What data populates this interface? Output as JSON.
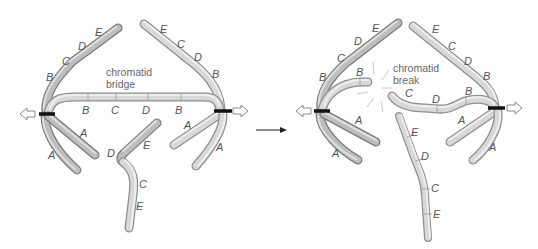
{
  "diagram": {
    "left_panel": {
      "caption_line1": "chromatid",
      "caption_line2": "bridge",
      "upper_left_arm_labels": [
        "B",
        "C",
        "D",
        "E"
      ],
      "upper_right_arm_labels": [
        "E",
        "C",
        "D",
        "B"
      ],
      "bridge_labels": [
        "B",
        "C",
        "D",
        "B"
      ],
      "lower_left_labels": [
        "A",
        "A"
      ],
      "lower_right_labels": [
        "A",
        "A"
      ],
      "acentric_fragment_labels": [
        "D",
        "E",
        "C",
        "E"
      ]
    },
    "right_panel": {
      "caption_line1": "chromatid",
      "caption_line2": "break",
      "upper_left_arm_labels": [
        "B",
        "C",
        "D",
        "E"
      ],
      "upper_right_arm_labels": [
        "E",
        "C",
        "D",
        "B"
      ],
      "broken_left_labels": [
        "B"
      ],
      "broken_right_labels": [
        "C",
        "D",
        "B"
      ],
      "lower_left_labels": [
        "A",
        "A"
      ],
      "lower_right_labels": [
        "A",
        "A"
      ],
      "fragment_labels": [
        "E",
        "D",
        "C",
        "E"
      ]
    },
    "transition_arrow": "right-arrow",
    "pull_direction_icons": [
      "left-hollow-arrow",
      "right-hollow-arrow",
      "left-hollow-arrow",
      "right-hollow-arrow"
    ],
    "colors": {
      "chromosome_outline": "#8e8e8e",
      "chromosome_fill": "#d8d8d8",
      "centromere": "#111111",
      "label_text": "#555555"
    }
  }
}
